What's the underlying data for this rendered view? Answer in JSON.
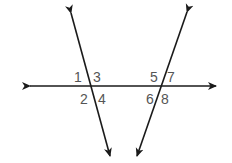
{
  "diagram": {
    "line_color": "#1a1a1a",
    "label_color": "#555555",
    "angle_labels": {
      "a1": "1",
      "a2": "2",
      "a3": "3",
      "a4": "4",
      "a5": "5",
      "a6": "6",
      "a7": "7",
      "a8": "8"
    }
  }
}
